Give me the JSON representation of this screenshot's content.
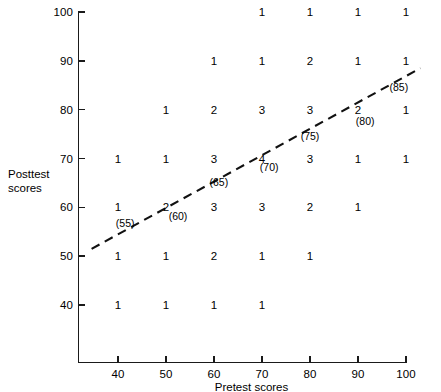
{
  "chart_data": {
    "type": "scatter",
    "title": "",
    "xlabel": "Pretest scores",
    "ylabel": "Posttest scores",
    "ylabel_lines": [
      "Posttest",
      "scores"
    ],
    "xlim": [
      33,
      103
    ],
    "ylim": [
      33,
      103
    ],
    "xticks": [
      40,
      50,
      60,
      70,
      80,
      90,
      100
    ],
    "yticks": [
      40,
      50,
      60,
      70,
      80,
      90,
      100
    ],
    "xtick_labels": [
      "40",
      "50",
      "60",
      "70",
      "80",
      "90",
      "100"
    ],
    "ytick_labels": [
      "40",
      "50",
      "60",
      "70",
      "80",
      "90",
      "100"
    ],
    "grid": false,
    "legend": "none",
    "marker_style": "frequency-count-text",
    "points": [
      {
        "x": 70,
        "y": 100,
        "count": "1"
      },
      {
        "x": 80,
        "y": 100,
        "count": "1"
      },
      {
        "x": 90,
        "y": 100,
        "count": "1"
      },
      {
        "x": 100,
        "y": 100,
        "count": "1"
      },
      {
        "x": 60,
        "y": 90,
        "count": "1"
      },
      {
        "x": 70,
        "y": 90,
        "count": "1"
      },
      {
        "x": 80,
        "y": 90,
        "count": "2"
      },
      {
        "x": 90,
        "y": 90,
        "count": "1"
      },
      {
        "x": 100,
        "y": 90,
        "count": "1"
      },
      {
        "x": 50,
        "y": 80,
        "count": "1"
      },
      {
        "x": 60,
        "y": 80,
        "count": "2"
      },
      {
        "x": 70,
        "y": 80,
        "count": "3"
      },
      {
        "x": 80,
        "y": 80,
        "count": "3"
      },
      {
        "x": 90,
        "y": 80,
        "count": "2"
      },
      {
        "x": 100,
        "y": 80,
        "count": "1"
      },
      {
        "x": 40,
        "y": 70,
        "count": "1"
      },
      {
        "x": 50,
        "y": 70,
        "count": "1"
      },
      {
        "x": 60,
        "y": 70,
        "count": "3"
      },
      {
        "x": 70,
        "y": 70,
        "count": "4"
      },
      {
        "x": 80,
        "y": 70,
        "count": "3"
      },
      {
        "x": 90,
        "y": 70,
        "count": "1"
      },
      {
        "x": 100,
        "y": 70,
        "count": "1"
      },
      {
        "x": 40,
        "y": 60,
        "count": "1"
      },
      {
        "x": 50,
        "y": 60,
        "count": "2"
      },
      {
        "x": 60,
        "y": 60,
        "count": "3"
      },
      {
        "x": 70,
        "y": 60,
        "count": "3"
      },
      {
        "x": 80,
        "y": 60,
        "count": "2"
      },
      {
        "x": 90,
        "y": 60,
        "count": "1"
      },
      {
        "x": 40,
        "y": 50,
        "count": "1"
      },
      {
        "x": 50,
        "y": 50,
        "count": "1"
      },
      {
        "x": 60,
        "y": 50,
        "count": "2"
      },
      {
        "x": 70,
        "y": 50,
        "count": "1"
      },
      {
        "x": 80,
        "y": 50,
        "count": "1"
      },
      {
        "x": 40,
        "y": 40,
        "count": "1"
      },
      {
        "x": 50,
        "y": 40,
        "count": "1"
      },
      {
        "x": 60,
        "y": 40,
        "count": "1"
      },
      {
        "x": 70,
        "y": 40,
        "count": "1"
      }
    ],
    "regression_line": {
      "style": "dashed",
      "color": "#111111",
      "x_start": 34.5,
      "y_start": 51.5,
      "x_end": 103,
      "y_end": 88.5,
      "predicted_labels": [
        {
          "text": "(55)",
          "x": 41.5,
          "y": 56.5
        },
        {
          "text": "(60)",
          "x": 52.5,
          "y": 58.0
        },
        {
          "text": "(65)",
          "x": 61.0,
          "y": 65.0
        },
        {
          "text": "(70)",
          "x": 71.5,
          "y": 68.0
        },
        {
          "text": "(75)",
          "x": 80.0,
          "y": 74.5
        },
        {
          "text": "(80)",
          "x": 91.5,
          "y": 77.5
        },
        {
          "text": "(85)",
          "x": 98.5,
          "y": 84.5
        }
      ]
    }
  },
  "axis": {
    "x_title": "Pretest scores",
    "y_title_line1": "Posttest",
    "y_title_line2": "scores"
  }
}
